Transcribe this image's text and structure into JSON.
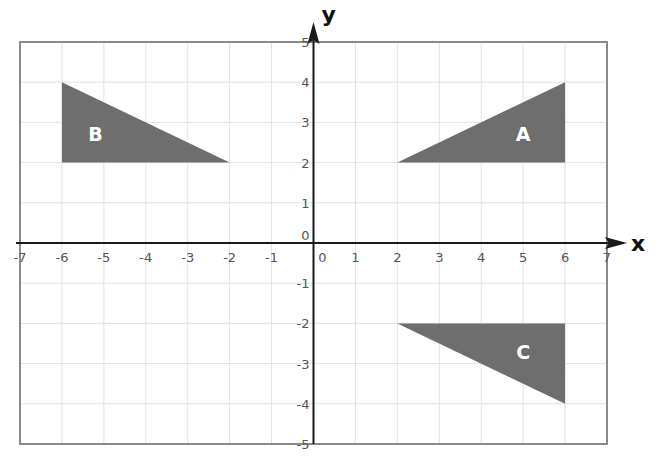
{
  "diagram": {
    "type": "coordinate-grid",
    "axes": {
      "x_label": "x",
      "y_label": "y",
      "x_range": [
        -7,
        7
      ],
      "y_range": [
        -5,
        5
      ],
      "x_ticks": [
        "-7",
        "-6",
        "-5",
        "-4",
        "-3",
        "-2",
        "-1",
        "0",
        "1",
        "2",
        "3",
        "4",
        "5",
        "6",
        "7"
      ],
      "y_ticks": [
        "5",
        "4",
        "3",
        "2",
        "1",
        "0",
        "-1",
        "-2",
        "-3",
        "-4",
        "-5"
      ],
      "grid": true
    },
    "shapes": [
      {
        "label": "A",
        "vertices": [
          [
            2,
            2
          ],
          [
            6,
            2
          ],
          [
            6,
            4
          ]
        ],
        "label_pos": [
          5,
          2.7
        ]
      },
      {
        "label": "B",
        "vertices": [
          [
            -6,
            4
          ],
          [
            -6,
            2
          ],
          [
            -2,
            2
          ]
        ],
        "label_pos": [
          -5.2,
          2.7
        ]
      },
      {
        "label": "C",
        "vertices": [
          [
            2,
            -2
          ],
          [
            6,
            -2
          ],
          [
            6,
            -4
          ]
        ],
        "label_pos": [
          5,
          -2.7
        ]
      }
    ],
    "colors": {
      "shape_fill": "#6e6e6e",
      "grid_line": "#e2e2e2",
      "frame": "#8a8a8a",
      "axis": "#1a1a1a",
      "tick_text": "#555555"
    }
  }
}
